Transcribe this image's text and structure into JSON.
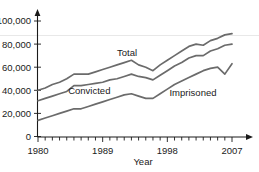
{
  "chart_data": {
    "type": "line",
    "title": "",
    "xlabel": "Year",
    "ylabel": "",
    "x": [
      1980,
      1981,
      1982,
      1983,
      1984,
      1985,
      1986,
      1987,
      1988,
      1989,
      1990,
      1991,
      1992,
      1993,
      1994,
      1995,
      1996,
      1997,
      1998,
      1999,
      2000,
      2001,
      2002,
      2003,
      2004,
      2005,
      2006,
      2007
    ],
    "series": [
      {
        "name": "Total",
        "label": "Total",
        "values": [
          40000,
          42000,
          45000,
          47000,
          50000,
          54000,
          54000,
          54000,
          56000,
          58000,
          60000,
          62000,
          64000,
          66000,
          62000,
          60000,
          57000,
          62000,
          66000,
          70000,
          74000,
          78000,
          80000,
          79000,
          83000,
          85000,
          88000,
          89000
        ]
      },
      {
        "name": "Convicted",
        "label": "Convicted",
        "values": [
          31000,
          33000,
          35000,
          37000,
          39000,
          44000,
          44000,
          45000,
          46000,
          47000,
          49000,
          50000,
          52000,
          54000,
          52000,
          51000,
          49000,
          53000,
          57000,
          61000,
          64000,
          68000,
          70000,
          70000,
          74000,
          76000,
          79000,
          80000
        ]
      },
      {
        "name": "Imprisoned",
        "label": "Imprisoned",
        "values": [
          14000,
          16000,
          18000,
          20000,
          22000,
          24000,
          24000,
          26000,
          28000,
          30000,
          32000,
          34000,
          36000,
          37000,
          35000,
          33000,
          33000,
          37000,
          41000,
          45000,
          48000,
          51000,
          54000,
          57000,
          59000,
          60000,
          54000,
          63000
        ]
      }
    ],
    "ylim": [
      0,
      108000
    ],
    "xlim": [
      1980,
      2008
    ],
    "y_ticks": [
      0,
      20000,
      40000,
      60000,
      80000,
      100000
    ],
    "y_tick_labels": [
      "0",
      "20,000",
      "40,000",
      "60,000",
      "80,000",
      "100,000"
    ],
    "x_ticks": [
      1980,
      1989,
      1998,
      2007
    ],
    "x_tick_labels": [
      "1980",
      "1989",
      "1998",
      "2007"
    ],
    "x_minor_tick_step": 1,
    "gridlines": [
      {
        "value": 85000,
        "color": "#e8e8e8",
        "orientation": "horizontal"
      }
    ],
    "grid": false,
    "legend": "inline-labels",
    "line_color": "#6b6b6b",
    "axis_color": "#1a1a1a",
    "background": "#ffffff",
    "annotations": [
      {
        "text": "Total",
        "x": 1991.0,
        "y": 70000
      },
      {
        "text": "Convicted",
        "x": 1984.2,
        "y": 36500
      },
      {
        "text": "Imprisoned",
        "x": 1998.3,
        "y": 35000
      }
    ]
  },
  "axis": {
    "x_title": "Year",
    "y_title": ""
  }
}
